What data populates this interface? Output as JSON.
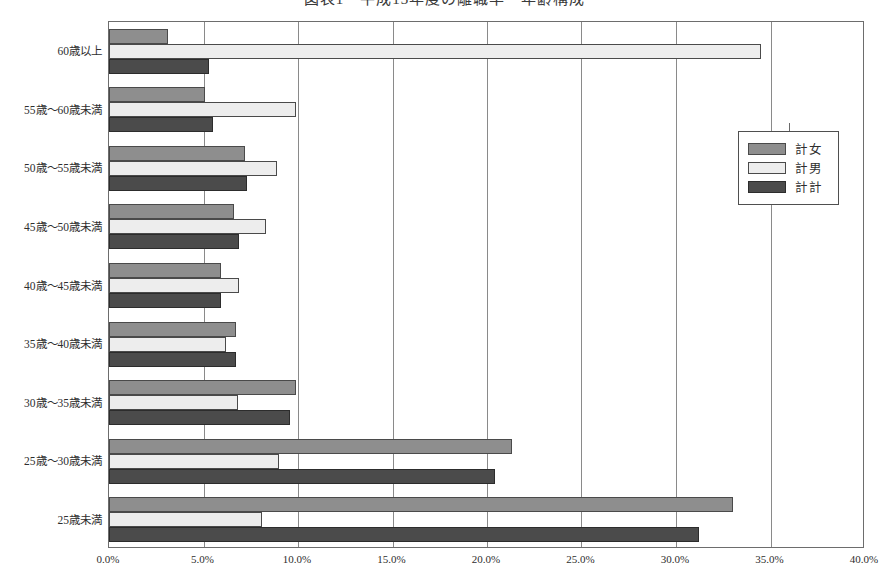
{
  "title": "図表1　平成13年度の離職率・年齢構成",
  "legend": {
    "position": "right",
    "entries": [
      "計女",
      "計男",
      "計計"
    ]
  },
  "axis": {
    "xlabel": "",
    "ylabel": "",
    "xticks": [
      "0.0%",
      "5.0%",
      "10.0%",
      "15.0%",
      "20.0%",
      "25.0%",
      "30.0%",
      "35.0%",
      "40.0%"
    ]
  },
  "colors": {
    "series_0": "#8e8e8e",
    "series_1": "#ededed",
    "series_2": "#4b4b4b",
    "frame": "#6d6d6d",
    "grid": "#8a8a8a",
    "background": "#ffffff"
  },
  "chart_data": {
    "type": "bar",
    "orientation": "horizontal",
    "title": "図表1　平成13年度の離職率・年齢構成",
    "xlabel": "",
    "ylabel": "",
    "xlim": [
      0,
      40
    ],
    "xtick_values": [
      0,
      5,
      10,
      15,
      20,
      25,
      30,
      35,
      40
    ],
    "xtick_labels": [
      "0.0%",
      "5.0%",
      "10.0%",
      "15.0%",
      "20.0%",
      "25.0%",
      "30.0%",
      "35.0%",
      "40.0%"
    ],
    "grid": true,
    "legend_position": "right",
    "unit": "%",
    "categories": [
      "60歳以上",
      "55歳～60歳未満",
      "50歳～55歳未満",
      "45歳～50歳未満",
      "40歳～45歳未満",
      "35歳～40歳未満",
      "30歳～35歳未満",
      "25歳～30歳未満",
      "25歳未満"
    ],
    "series": [
      {
        "name": "計女",
        "color": "#8e8e8e",
        "values": [
          3.1,
          5.1,
          7.2,
          6.6,
          5.9,
          6.7,
          9.9,
          21.3,
          33.0
        ]
      },
      {
        "name": "計男",
        "color": "#ededed",
        "values": [
          34.5,
          9.9,
          8.9,
          8.3,
          6.9,
          6.2,
          6.8,
          9.0,
          8.1
        ]
      },
      {
        "name": "計計",
        "color": "#4b4b4b",
        "values": [
          5.3,
          5.5,
          7.3,
          6.9,
          5.9,
          6.7,
          9.6,
          20.4,
          31.2
        ]
      }
    ]
  }
}
